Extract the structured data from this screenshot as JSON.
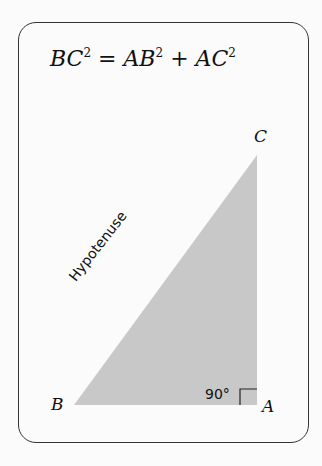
{
  "formula": {
    "lhs": "BC",
    "rhs1": "AB",
    "rhs2": "AC",
    "exp": "2",
    "eq": " = ",
    "plus": " + "
  },
  "diagram": {
    "vertices": {
      "B": "B",
      "A": "A",
      "C": "C"
    },
    "hypotenuse_label": "Hypotenuse",
    "angle_label": "90°",
    "fill_color": "#c8c8c8"
  }
}
